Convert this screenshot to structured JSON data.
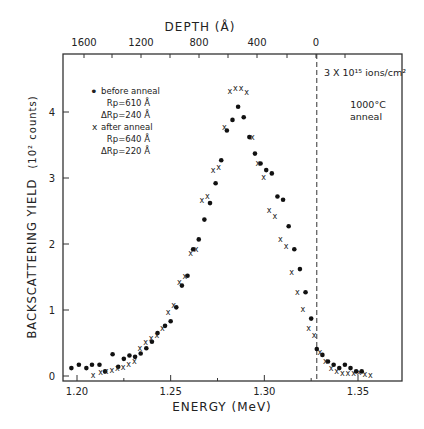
{
  "chart_data": {
    "type": "scatter",
    "title": "",
    "xlabel": "ENERGY (MeV)",
    "ylabel": "BACKSCATTERING YIELD",
    "ylabel_units": "(10² counts)",
    "top_xlabel": "DEPTH (Å)",
    "xlim": [
      1.193,
      1.373
    ],
    "ylim": [
      0,
      4.9
    ],
    "x_ticks": [
      1.2,
      1.25,
      1.3,
      1.35
    ],
    "x_tick_labels": [
      "1.20",
      "1.25",
      "1.30",
      "1.35"
    ],
    "y_ticks": [
      0,
      1,
      2,
      3,
      4
    ],
    "y_tick_labels": [
      "0",
      "1",
      "2",
      "3",
      "4"
    ],
    "top_ticks_energy": [
      1.236,
      1.282,
      1.328,
      1.19,
      1.259,
      1.305,
      1.213
    ],
    "top_tick_labels": [
      {
        "label": "1600",
        "energy": 1.19
      },
      {
        "label": "1200",
        "energy": 1.236
      },
      {
        "label": "800",
        "energy": 1.282
      },
      {
        "label": "400",
        "energy": 1.305
      },
      {
        "label": "0",
        "energy": 1.328
      }
    ],
    "grid": false,
    "surface_marker": {
      "energy": 1.328,
      "style": "dashed"
    },
    "annotations": [
      {
        "text": "3 X 10¹⁵ ions/cm²"
      },
      {
        "text": "1000°C"
      },
      {
        "text": "anneal"
      }
    ],
    "legend": {
      "position": "upper-left",
      "entries": [
        {
          "marker": "•",
          "label": "before anneal",
          "rp": "Rp=610 Å",
          "drp": "ΔRp=240 Å"
        },
        {
          "marker": "x",
          "label": "after anneal",
          "rp": "Rp=640 Å",
          "drp": "ΔRp=220 Å"
        }
      ]
    },
    "series": [
      {
        "name": "before anneal",
        "marker": "dot",
        "x": [
          1.197,
          1.201,
          1.205,
          1.208,
          1.212,
          1.215,
          1.219,
          1.222,
          1.225,
          1.228,
          1.231,
          1.234,
          1.237,
          1.24,
          1.243,
          1.247,
          1.25,
          1.253,
          1.256,
          1.259,
          1.262,
          1.265,
          1.268,
          1.271,
          1.274,
          1.277,
          1.28,
          1.283,
          1.286,
          1.289,
          1.292,
          1.295,
          1.298,
          1.301,
          1.304,
          1.307,
          1.31,
          1.313,
          1.316,
          1.319,
          1.322,
          1.325,
          1.328,
          1.331,
          1.334,
          1.337,
          1.34,
          1.343,
          1.346,
          1.349,
          1.352
        ],
        "y": [
          0.12,
          0.17,
          0.12,
          0.17,
          0.17,
          0.07,
          0.33,
          0.14,
          0.26,
          0.31,
          0.29,
          0.34,
          0.42,
          0.52,
          0.65,
          0.76,
          0.83,
          1.04,
          1.37,
          1.52,
          1.92,
          2.07,
          2.37,
          2.62,
          2.92,
          3.27,
          3.72,
          3.88,
          4.08,
          3.92,
          3.62,
          3.37,
          3.22,
          3.12,
          3.07,
          2.72,
          2.67,
          2.27,
          1.92,
          1.62,
          1.27,
          0.87,
          0.41,
          0.32,
          0.22,
          0.17,
          0.12,
          0.17,
          0.12,
          0.07,
          0.07
        ]
      },
      {
        "name": "after anneal",
        "marker": "x",
        "x": [
          1.207,
          1.211,
          1.214,
          1.217,
          1.22,
          1.223,
          1.226,
          1.229,
          1.232,
          1.235,
          1.238,
          1.241,
          1.244,
          1.247,
          1.25,
          1.253,
          1.256,
          1.259,
          1.262,
          1.265,
          1.268,
          1.271,
          1.274,
          1.277,
          1.28,
          1.283,
          1.286,
          1.289,
          1.292,
          1.295,
          1.298,
          1.301,
          1.304,
          1.307,
          1.31,
          1.313,
          1.316,
          1.319,
          1.322,
          1.325,
          1.328,
          1.331,
          1.334,
          1.337,
          1.34,
          1.343,
          1.346,
          1.349,
          1.352,
          1.355
        ],
        "y": [
          0.02,
          0.06,
          0.07,
          0.09,
          0.12,
          0.14,
          0.18,
          0.22,
          0.42,
          0.52,
          0.57,
          0.62,
          0.72,
          0.97,
          1.07,
          1.42,
          1.52,
          1.87,
          1.92,
          2.67,
          2.72,
          3.12,
          3.17,
          3.77,
          4.32,
          4.37,
          4.37,
          4.3,
          3.62,
          3.22,
          3.02,
          2.52,
          2.42,
          2.07,
          1.97,
          1.57,
          1.27,
          1.02,
          0.72,
          0.62,
          0.37,
          0.22,
          0.12,
          0.07,
          0.05,
          0.04,
          0.05,
          0.06,
          0.03,
          0.02
        ]
      }
    ]
  }
}
